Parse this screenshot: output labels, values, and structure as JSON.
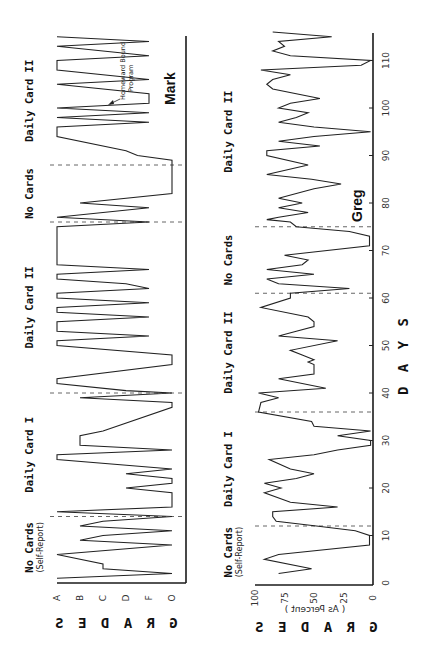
{
  "figure": {
    "x_axis_title": "D A Y S",
    "orientation_note": "rotated 90 degrees counter-clockwise"
  },
  "chart_data": [
    {
      "type": "line",
      "subject": "Mark",
      "ylabel": "G R A D E S",
      "xlabel": "D A Y S",
      "y_ticks": [
        "A",
        "B",
        "C",
        "D",
        "F",
        "O"
      ],
      "x_ticks": [
        10,
        20,
        30,
        40,
        50,
        60,
        70,
        80,
        90,
        100,
        110
      ],
      "xlim": [
        0,
        115
      ],
      "phases": [
        {
          "label": "No Cards",
          "sub": "(Self-Report)",
          "start": 1,
          "end": 14
        },
        {
          "label": "Daily Card I",
          "start": 14,
          "end": 40
        },
        {
          "label": "Daily Card II",
          "start": 40,
          "end": 76
        },
        {
          "label": "No Cards",
          "start": 76,
          "end": 88
        },
        {
          "label": "Daily Card II",
          "start": 88,
          "end": 115
        }
      ],
      "phase_lines": [
        14,
        40,
        76,
        88
      ],
      "annotations": [
        {
          "text": "Homeward Bound Program",
          "day": 103,
          "grade": "F"
        }
      ],
      "series": [
        {
          "name": "Mark",
          "points": [
            [
              1,
              "A"
            ],
            [
              2,
              "O"
            ],
            [
              3,
              "C"
            ],
            [
              4,
              "C"
            ],
            [
              6,
              "A"
            ],
            [
              8,
              "O"
            ],
            [
              9,
              "B"
            ],
            [
              10,
              "C"
            ],
            [
              11,
              "O"
            ],
            [
              12,
              "B"
            ],
            [
              13,
              "C"
            ],
            [
              14,
              "O"
            ],
            [
              15,
              "A"
            ],
            [
              16,
              "O"
            ],
            [
              19,
              "O"
            ],
            [
              20,
              "D"
            ],
            [
              21,
              "O"
            ],
            [
              22,
              "O"
            ],
            [
              23,
              "D"
            ],
            [
              24,
              "O"
            ],
            [
              26,
              "A"
            ],
            [
              27,
              "A"
            ],
            [
              28,
              "O"
            ],
            [
              29,
              "B"
            ],
            [
              31,
              "B"
            ],
            [
              32,
              "C"
            ],
            [
              37,
              "O"
            ],
            [
              38,
              "O"
            ],
            [
              39,
              "B"
            ],
            [
              40,
              "O"
            ],
            [
              40.5,
              "D"
            ],
            [
              42,
              "A"
            ],
            [
              43,
              "A"
            ],
            [
              46,
              "O"
            ],
            [
              48,
              "O"
            ],
            [
              50,
              "A"
            ],
            [
              51,
              "A"
            ],
            [
              52,
              "F"
            ],
            [
              53,
              "A"
            ],
            [
              55,
              "A"
            ],
            [
              56,
              "F"
            ],
            [
              57,
              "A"
            ],
            [
              58,
              "A"
            ],
            [
              59,
              "F"
            ],
            [
              60,
              "A"
            ],
            [
              61,
              "A"
            ],
            [
              62,
              "F"
            ],
            [
              63,
              "D"
            ],
            [
              64,
              "A"
            ],
            [
              65,
              "A"
            ],
            [
              66,
              "F"
            ],
            [
              67,
              "A"
            ],
            [
              75,
              "A"
            ],
            [
              76,
              "F"
            ],
            [
              77,
              "A"
            ],
            [
              79,
              "F"
            ],
            [
              80,
              "B"
            ],
            [
              82,
              "O"
            ],
            [
              88,
              "O"
            ],
            [
              89,
              "O"
            ],
            [
              90,
              "E"
            ],
            [
              91,
              "D"
            ],
            [
              94,
              "A"
            ],
            [
              96,
              "A"
            ],
            [
              97,
              "F"
            ],
            [
              98,
              "A"
            ],
            [
              99,
              "F"
            ],
            [
              100,
              "A"
            ],
            [
              101,
              "F"
            ],
            [
              103,
              "F"
            ],
            [
              105,
              "A"
            ],
            [
              106,
              "F"
            ],
            [
              108,
              "A"
            ],
            [
              110,
              "A"
            ],
            [
              111,
              "F"
            ],
            [
              113,
              "A"
            ],
            [
              114,
              "F"
            ],
            [
              115,
              "A"
            ]
          ]
        }
      ]
    },
    {
      "type": "line",
      "subject": "Greg",
      "ylabel": "G R A D E S",
      "ylabel_sub": "( As Percent )",
      "xlabel": "D A Y S",
      "y_ticks": [
        0,
        25,
        50,
        75,
        100
      ],
      "x_ticks": [
        10,
        20,
        30,
        40,
        50,
        60,
        70,
        80,
        90,
        100,
        110
      ],
      "ylim": [
        0,
        100
      ],
      "xlim": [
        0,
        115
      ],
      "phases": [
        {
          "label": "No Cards",
          "sub": "(Self-Report)",
          "start": 1,
          "end": 12
        },
        {
          "label": "Daily Card I",
          "start": 12,
          "end": 36
        },
        {
          "label": "Daily Card II",
          "start": 36,
          "end": 61
        },
        {
          "label": "No Cards",
          "start": 61,
          "end": 75
        },
        {
          "label": "Daily Card II",
          "start": 75,
          "end": 115
        }
      ],
      "phase_lines": [
        12,
        36,
        61,
        75
      ],
      "series": [
        {
          "name": "Greg",
          "points": [
            [
              2,
              80
            ],
            [
              3,
              52
            ],
            [
              5,
              92
            ],
            [
              6,
              80
            ],
            [
              8,
              3
            ],
            [
              10,
              3
            ],
            [
              11,
              15
            ],
            [
              12,
              48
            ],
            [
              13,
              82
            ],
            [
              14,
              85
            ],
            [
              15,
              85
            ],
            [
              16,
              30
            ],
            [
              17,
              70
            ],
            [
              19,
              92
            ],
            [
              20,
              78
            ],
            [
              21,
              92
            ],
            [
              22,
              65
            ],
            [
              23,
              50
            ],
            [
              24,
              70
            ],
            [
              26,
              88
            ],
            [
              27,
              50
            ],
            [
              28,
              30
            ],
            [
              29,
              2
            ],
            [
              30,
              2
            ],
            [
              31,
              30
            ],
            [
              32,
              2
            ],
            [
              33,
              50
            ],
            [
              34,
              52
            ],
            [
              36,
              97
            ],
            [
              38,
              95
            ],
            [
              39,
              80
            ],
            [
              40,
              97
            ],
            [
              41,
              40
            ],
            [
              43,
              80
            ],
            [
              44,
              50
            ],
            [
              46,
              50
            ],
            [
              46.5,
              55
            ],
            [
              47,
              50
            ],
            [
              48,
              60
            ],
            [
              49,
              70
            ],
            [
              51,
              30
            ],
            [
              52,
              80
            ],
            [
              53,
              65
            ],
            [
              54,
              50
            ],
            [
              55,
              50
            ],
            [
              56,
              55
            ],
            [
              58,
              95
            ],
            [
              60,
              70
            ],
            [
              61,
              70
            ],
            [
              62,
              20
            ],
            [
              63,
              80
            ],
            [
              64,
              90
            ],
            [
              65,
              50
            ],
            [
              66,
              90
            ],
            [
              67,
              60
            ],
            [
              68,
              55
            ],
            [
              69,
              75
            ],
            [
              71,
              3
            ],
            [
              73,
              3
            ],
            [
              74,
              20
            ],
            [
              75,
              65
            ],
            [
              76,
              70
            ],
            [
              76.5,
              90
            ],
            [
              77,
              80
            ],
            [
              78,
              55
            ],
            [
              79,
              80
            ],
            [
              80,
              60
            ],
            [
              81,
              80
            ],
            [
              83,
              50
            ],
            [
              84,
              27
            ],
            [
              85,
              52
            ],
            [
              86,
              90
            ],
            [
              88,
              55
            ],
            [
              90,
              90
            ],
            [
              91,
              90
            ],
            [
              92,
              45
            ],
            [
              93,
              80
            ],
            [
              94,
              50
            ],
            [
              95,
              2
            ],
            [
              96,
              50
            ],
            [
              97,
              80
            ],
            [
              98,
              65
            ],
            [
              99,
              55
            ],
            [
              100,
              80
            ],
            [
              101,
              70
            ],
            [
              102,
              45
            ],
            [
              104,
              85
            ],
            [
              105,
              90
            ],
            [
              106,
              85
            ],
            [
              107,
              70
            ],
            [
              108,
              95
            ],
            [
              109,
              10
            ],
            [
              110,
              2
            ],
            [
              111,
              70
            ],
            [
              112,
              85
            ],
            [
              113,
              75
            ],
            [
              114,
              80
            ],
            [
              115,
              35
            ],
            [
              116,
              85
            ]
          ]
        }
      ]
    }
  ]
}
